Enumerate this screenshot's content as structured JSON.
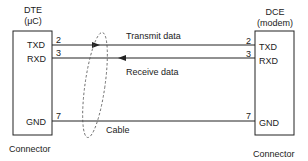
{
  "left_device": {
    "title": "DTE",
    "subtitle": "(μC)",
    "caption": "Connector",
    "pins": [
      {
        "name": "TXD",
        "number": "2"
      },
      {
        "name": "RXD",
        "number": "3"
      },
      {
        "name": "GND",
        "number": "7"
      }
    ]
  },
  "right_device": {
    "title": "DCE",
    "subtitle": "(modem)",
    "caption": "Connector",
    "pins": [
      {
        "name": "TXD",
        "number": "2"
      },
      {
        "name": "RXD",
        "number": "3"
      },
      {
        "name": "GND",
        "number": "7"
      }
    ]
  },
  "signals": {
    "transmit": "Transmit data",
    "receive": "Receive data"
  },
  "cable_label": "Cable",
  "colors": {
    "line": "#222222",
    "background": "#ffffff"
  }
}
